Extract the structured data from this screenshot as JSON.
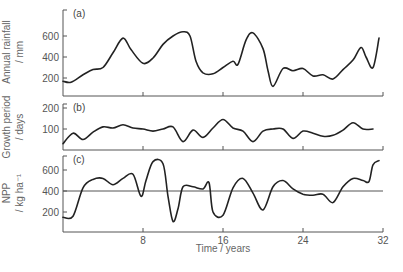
{
  "chart_data": [
    {
      "type": "line",
      "panel_label": "(a)",
      "ylabel_lines": [
        "Annual rainfall",
        "/ mm"
      ],
      "xlabel": "",
      "yticks": [
        200,
        400,
        600
      ],
      "ylim": [
        0,
        750
      ],
      "xlim": [
        0,
        32
      ],
      "x": [
        0,
        0.8,
        2,
        3,
        4,
        5,
        6,
        6.8,
        8,
        9,
        10,
        11,
        12,
        12.7,
        13.3,
        14,
        15,
        16,
        17,
        17.5,
        18.3,
        19,
        20,
        20.5,
        21,
        22,
        23,
        24,
        25,
        26,
        27,
        28,
        29,
        29.8,
        30.3,
        31,
        31.6
      ],
      "values": [
        170,
        160,
        230,
        280,
        300,
        440,
        580,
        470,
        340,
        390,
        520,
        600,
        640,
        600,
        360,
        250,
        240,
        300,
        360,
        330,
        560,
        630,
        480,
        270,
        120,
        290,
        270,
        290,
        220,
        230,
        190,
        280,
        370,
        490,
        400,
        300,
        580
      ]
    },
    {
      "type": "line",
      "panel_label": "(b)",
      "ylabel_lines": [
        "Growth period",
        "/ days"
      ],
      "xlabel": "",
      "yticks": [
        100,
        200
      ],
      "ylim": [
        0,
        220
      ],
      "xlim": [
        0,
        32
      ],
      "x": [
        0,
        1,
        2,
        3,
        4,
        5,
        6,
        7,
        8,
        9,
        10,
        11,
        12,
        13,
        14,
        15,
        16,
        17,
        18,
        19,
        20,
        21,
        22,
        23,
        24,
        25,
        26,
        27,
        28,
        29,
        30,
        31
      ],
      "values": [
        30,
        80,
        50,
        85,
        110,
        105,
        120,
        105,
        100,
        90,
        100,
        110,
        40,
        95,
        60,
        105,
        145,
        105,
        90,
        40,
        90,
        100,
        100,
        55,
        90,
        80,
        65,
        70,
        95,
        130,
        100,
        100
      ]
    },
    {
      "type": "line",
      "panel_label": "(c)",
      "ylabel_lines": [
        "NPP",
        "/ kg ha⁻¹"
      ],
      "xlabel": "Time / years",
      "yticks": [
        200,
        400,
        600
      ],
      "xticks": [
        8,
        16,
        24,
        32
      ],
      "ylim": [
        0,
        750
      ],
      "xlim": [
        0,
        32
      ],
      "reference_line": 400,
      "x": [
        0,
        1,
        2,
        3,
        4,
        5,
        6,
        7,
        7.8,
        8.3,
        9,
        10,
        10.5,
        11,
        11.5,
        12,
        13,
        14,
        14.6,
        15,
        16,
        17,
        18,
        19,
        20,
        21,
        22,
        23,
        24,
        25,
        26,
        27,
        28,
        29,
        30,
        30.6,
        31,
        31.6
      ],
      "values": [
        150,
        160,
        430,
        510,
        520,
        460,
        520,
        560,
        350,
        500,
        680,
        660,
        350,
        110,
        230,
        440,
        440,
        420,
        480,
        200,
        170,
        430,
        520,
        380,
        220,
        440,
        500,
        420,
        370,
        360,
        370,
        290,
        440,
        520,
        500,
        490,
        650,
        690
      ]
    }
  ]
}
